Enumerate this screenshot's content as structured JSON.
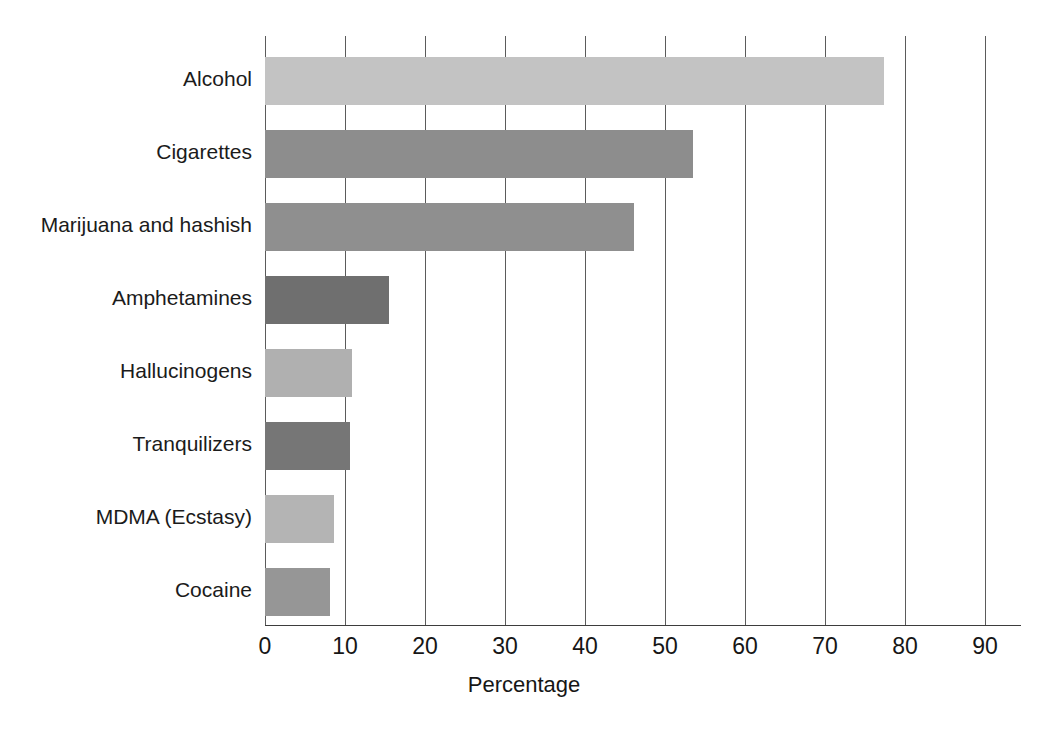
{
  "chart_data": {
    "type": "bar",
    "orientation": "horizontal",
    "title": "",
    "subtitle": "",
    "xlabel": "Percentage",
    "ylabel": "",
    "xlim": [
      0,
      90
    ],
    "xticks": [
      0,
      10,
      20,
      30,
      40,
      50,
      60,
      70,
      80,
      90
    ],
    "xtick_labels": [
      "0",
      "10",
      "20",
      "30",
      "40",
      "50",
      "60",
      "70",
      "80",
      "90"
    ],
    "grid": true,
    "grid_axis": "x",
    "legend": false,
    "legend_position": "none",
    "categories": [
      "Alcohol",
      "Cigarettes",
      "Marijuana and hashish",
      "Amphetamines",
      "Hallucinogens",
      "Tranquilizers",
      "MDMA (Ecstasy)",
      "Cocaine"
    ],
    "values": [
      77.4,
      53.5,
      46.1,
      15.5,
      10.9,
      10.6,
      8.6,
      8.1
    ],
    "bar_colors": [
      "#c3c3c3",
      "#8d8d8d",
      "#8f8f8f",
      "#6f6f6f",
      "#b0b0b0",
      "#767676",
      "#b4b4b4",
      "#969696"
    ],
    "series": [
      {
        "name": "Percentage",
        "values": [
          77.4,
          53.5,
          46.1,
          15.5,
          10.9,
          10.6,
          8.6,
          8.1
        ]
      }
    ]
  },
  "axis": {
    "x_title": "Percentage",
    "tick_color": "#5b5b5b",
    "axis_color": "#3d3d3d"
  },
  "page": {
    "background": "#ffffff"
  }
}
